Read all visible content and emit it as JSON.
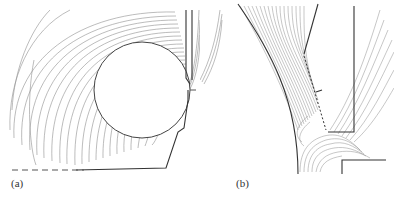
{
  "figure": {
    "panels": [
      {
        "id": "a",
        "label": "(a)",
        "description": "Field/equipotential lines surrounding a circular conductor with electrode edges, dashed ground line"
      },
      {
        "id": "b",
        "label": "(b)",
        "description": "Zoomed view of the gap region near the circle edge and electrode tip"
      }
    ],
    "colors": {
      "lines": "#8a8a8a",
      "electrode": "#333333",
      "background": "#ffffff"
    }
  }
}
